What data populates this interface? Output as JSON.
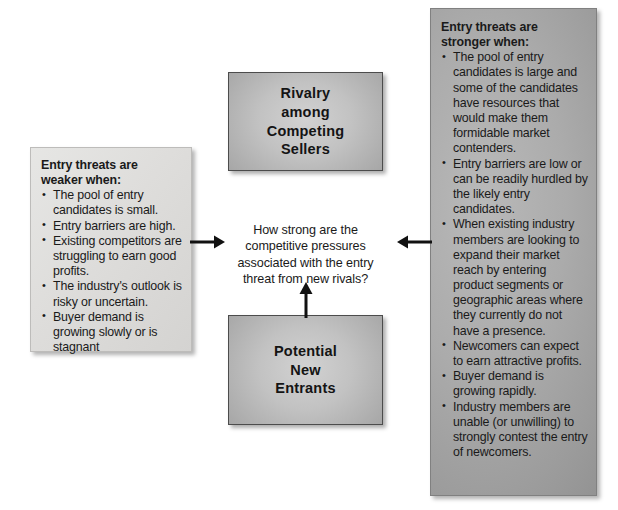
{
  "diagram": {
    "title": "Entry threat from new rivals",
    "center_question": "How strong are the\ncompetitive pressures\nassociated with the entry\nthreat from new rivals?",
    "nodes": [
      {
        "id": "rivalry",
        "label": "Rivalry\namong\nCompeting\nSellers"
      },
      {
        "id": "entrants",
        "label": "Potential\nNew\nEntrants"
      }
    ],
    "left_panel": {
      "heading": "Entry threats are\nweaker when:",
      "bullets": [
        "The pool of entry candidates is small.",
        "Entry barriers are high.",
        "Existing competitors are struggling to earn good profits.",
        "The industry's outlook is risky or uncertain.",
        "Buyer demand is growing slowly or is stagnant"
      ]
    },
    "right_panel": {
      "heading": "Entry threats are\nstronger when:",
      "bullets": [
        "The pool of entry candidates is large and some of the candidates have resources that would make them formidable market contenders.",
        "Entry barriers are low or can be readily hurdled by the likely entry candidates.",
        "When existing industry members are looking to expand their market reach by entering product segments or geographic areas where they currently do not have a presence.",
        "Newcomers can expect to earn attractive profits.",
        "Buyer demand is growing rapidly.",
        "Industry members are unable (or unwilling) to strongly contest the entry of newcomers."
      ]
    },
    "connectors": [
      {
        "id": "left-to-center",
        "direction": "right",
        "from": "left_panel",
        "to": "center_question"
      },
      {
        "id": "right-to-center",
        "direction": "left",
        "from": "right_panel",
        "to": "center_question"
      },
      {
        "id": "entrants-to-center",
        "direction": "up",
        "from": "entrants",
        "to": "center_question"
      }
    ],
    "colors": {
      "page_background": "#ffffff",
      "light_panel": "#dedddb",
      "dark_panel": "#a8a8a8",
      "node_fill": "#c0c0c0",
      "text": "#1a1a1a",
      "border": "#808080"
    }
  }
}
